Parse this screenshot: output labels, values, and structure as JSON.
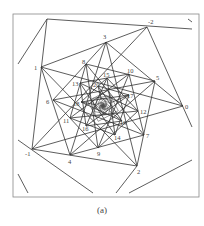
{
  "figure": {
    "caption": "(a)",
    "frame": {
      "x": 13,
      "y": 14,
      "width": 186,
      "height": 183,
      "stroke": "#888888"
    },
    "line_color": "#333333",
    "label_color": "#444444",
    "center": [
      103,
      106
    ],
    "points": [
      {
        "label": "-2",
        "x": 147,
        "y": 27,
        "lx": 148,
        "ly": 24
      },
      {
        "label": "-1",
        "x": 32,
        "y": 149,
        "lx": 25,
        "ly": 156
      },
      {
        "label": "0",
        "x": 183,
        "y": 106,
        "lx": 185,
        "ly": 109
      },
      {
        "label": "1",
        "x": 41,
        "y": 67,
        "lx": 34,
        "ly": 70
      },
      {
        "label": "2",
        "x": 137,
        "y": 166,
        "lx": 137,
        "ly": 174
      },
      {
        "label": "3",
        "x": 106,
        "y": 42,
        "lx": 103,
        "ly": 39
      },
      {
        "label": "4",
        "x": 70,
        "y": 155,
        "lx": 68,
        "ly": 164
      },
      {
        "label": "5",
        "x": 155,
        "y": 81,
        "lx": 156,
        "ly": 80
      },
      {
        "label": "6",
        "x": 53,
        "y": 100,
        "lx": 46,
        "ly": 104
      },
      {
        "label": "7",
        "x": 144,
        "y": 135,
        "lx": 146,
        "ly": 138
      },
      {
        "label": "8",
        "x": 86,
        "y": 64,
        "lx": 82,
        "ly": 64
      },
      {
        "label": "9",
        "x": 98,
        "y": 148,
        "lx": 97,
        "ly": 156
      },
      {
        "label": "10",
        "x": 129,
        "y": 74,
        "lx": 127,
        "ly": 73
      },
      {
        "label": "11",
        "x": 70,
        "y": 118,
        "lx": 63,
        "ly": 123
      },
      {
        "label": "12",
        "x": 138,
        "y": 111,
        "lx": 140,
        "ly": 114
      },
      {
        "label": "13",
        "x": 80,
        "y": 83,
        "lx": 72,
        "ly": 86
      },
      {
        "label": "14",
        "x": 115,
        "y": 135,
        "lx": 114,
        "ly": 140
      },
      {
        "label": "15",
        "x": 107,
        "y": 78,
        "lx": 103,
        "ly": 77
      },
      {
        "label": "16",
        "x": 86,
        "y": 126,
        "lx": 82,
        "ly": 131
      },
      {
        "label": "17",
        "x": 129,
        "y": 95,
        "lx": 127,
        "ly": 98
      },
      {
        "label": "18",
        "x": 81,
        "y": 102,
        "lx": 73,
        "ly": 106
      },
      {
        "label": "19",
        "x": 122,
        "y": 121,
        "lx": 120,
        "ly": 125
      },
      {
        "label": "20",
        "x": 98,
        "y": 86,
        "lx": 93,
        "ly": 87
      }
    ],
    "outer_segments": [
      [
        [
          47,
          19
        ],
        [
          18,
          64
        ]
      ],
      [
        [
          47,
          19
        ],
        [
          192,
          29
        ]
      ],
      [
        [
          188,
          19
        ],
        [
          192,
          22
        ]
      ],
      [
        [
          147,
          27
        ],
        [
          192,
          127
        ]
      ],
      [
        [
          192,
          160
        ],
        [
          129,
          193
        ]
      ],
      [
        [
          18,
          140
        ],
        [
          93,
          193
        ]
      ],
      [
        [
          18,
          174
        ],
        [
          28,
          193
        ]
      ],
      [
        [
          47,
          19
        ],
        [
          32,
          149
        ]
      ],
      [
        [
          137,
          166
        ],
        [
          116,
          193
        ]
      ]
    ]
  }
}
